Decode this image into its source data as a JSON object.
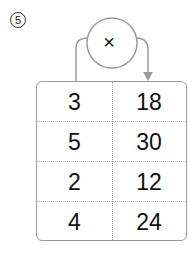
{
  "problem": {
    "number": "5",
    "operator": "×"
  },
  "table": {
    "rows": [
      {
        "input": "3",
        "output": "18"
      },
      {
        "input": "5",
        "output": "30"
      },
      {
        "input": "2",
        "output": "12"
      },
      {
        "input": "4",
        "output": "24"
      }
    ]
  },
  "colors": {
    "line": "#9a9a9a",
    "text": "#111111"
  }
}
